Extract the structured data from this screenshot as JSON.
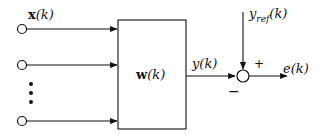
{
  "diagram": {
    "inputs": {
      "label": "x(k)",
      "count_visible": 3,
      "ellipsis": "vertical-dots"
    },
    "filter_block": {
      "label": "w(k)"
    },
    "output": {
      "label": "y(k)"
    },
    "reference": {
      "label": "y",
      "subscript": "ref",
      "suffix": "(k)"
    },
    "summing_junction": {
      "plus_sign": "+",
      "minus_sign": "−"
    },
    "error": {
      "label": "e(k)"
    },
    "colors": {
      "stroke": "#111111",
      "background": "#ffffff"
    }
  }
}
